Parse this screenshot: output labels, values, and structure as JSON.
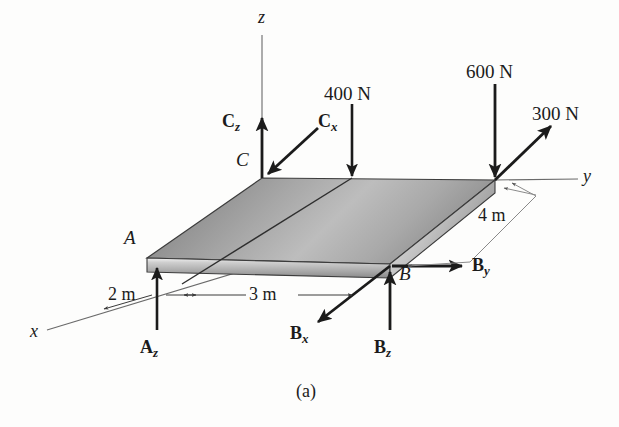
{
  "figure": {
    "caption": "(a)",
    "background_color": "#fdfdfc",
    "ink_color": "#1b1b1b"
  },
  "axes": [
    {
      "name": "z-axis",
      "label": "z"
    },
    {
      "name": "y-axis",
      "label": "y"
    },
    {
      "name": "x-axis",
      "label": "x"
    }
  ],
  "points": [
    {
      "name": "point-a",
      "label": "A"
    },
    {
      "name": "point-b",
      "label": "B"
    },
    {
      "name": "point-c",
      "label": "C"
    }
  ],
  "applied_loads": [
    {
      "name": "load-400n",
      "label": "400 N",
      "direction": "down",
      "magnitude": 400,
      "unit": "N"
    },
    {
      "name": "load-600n",
      "label": "600 N",
      "direction": "down",
      "magnitude": 600,
      "unit": "N"
    },
    {
      "name": "load-300n",
      "label": "300 N",
      "direction": "up-right",
      "magnitude": 300,
      "unit": "N"
    }
  ],
  "reactions": [
    {
      "name": "reaction-cz",
      "base": "C",
      "sub": "z",
      "direction": "up"
    },
    {
      "name": "reaction-cx",
      "base": "C",
      "sub": "x",
      "direction": "down-left"
    },
    {
      "name": "reaction-az",
      "base": "A",
      "sub": "z",
      "direction": "up"
    },
    {
      "name": "reaction-bz",
      "base": "B",
      "sub": "z",
      "direction": "up"
    },
    {
      "name": "reaction-by",
      "base": "B",
      "sub": "y",
      "direction": "right"
    },
    {
      "name": "reaction-bx",
      "base": "B",
      "sub": "x",
      "direction": "down-left"
    }
  ],
  "dimensions": [
    {
      "name": "dimension-2m",
      "label": "2 m",
      "value": 2,
      "unit": "m",
      "axis": "x"
    },
    {
      "name": "dimension-3m",
      "label": "3 m",
      "value": 3,
      "unit": "m",
      "axis": "x"
    },
    {
      "name": "dimension-4m",
      "label": "4 m",
      "value": 4,
      "unit": "m",
      "axis": "y"
    }
  ],
  "plate": {
    "name": "rectangular-plate",
    "shading": "gray-gradient",
    "corners": [
      "A",
      "C",
      "B",
      "O"
    ]
  }
}
